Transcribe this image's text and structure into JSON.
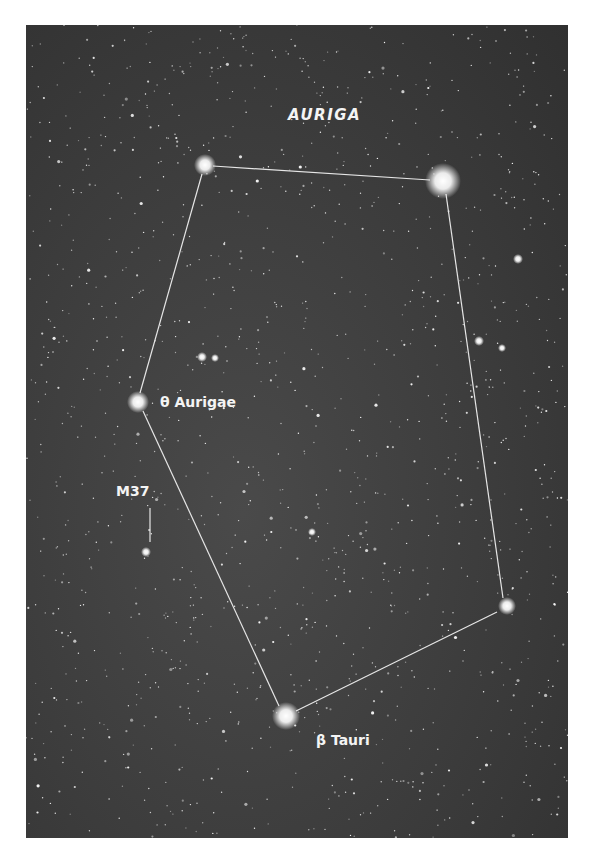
{
  "figure": {
    "title": "AURIGA",
    "labels": {
      "theta": "θ Aurigae",
      "m37": "M37",
      "beta": "β Tauri"
    },
    "colors": {
      "sky": "#3c3c3c",
      "stars": "#ffffff",
      "lines": "#e8e8e8",
      "text": "#f4f4f4",
      "page": "#ffffff"
    },
    "constellation_stars": [
      {
        "name": "top-left-star",
        "x": 205,
        "y": 165,
        "r": 7
      },
      {
        "name": "capella",
        "x": 443,
        "y": 181,
        "r": 12
      },
      {
        "name": "right-star",
        "x": 507,
        "y": 606,
        "r": 6
      },
      {
        "name": "beta-tauri",
        "x": 286,
        "y": 716,
        "r": 9
      },
      {
        "name": "theta-aurigae",
        "x": 138,
        "y": 402,
        "r": 7
      }
    ]
  }
}
